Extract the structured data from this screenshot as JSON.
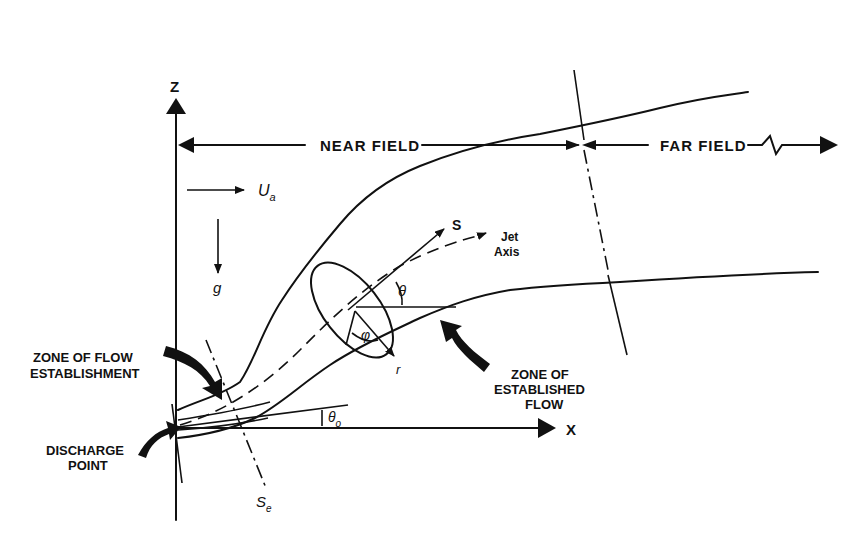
{
  "figure": {
    "type": "schematic",
    "axes": {
      "vertical_label": "Z",
      "horizontal_label": "X"
    },
    "regions": {
      "near_field_label": "NEAR FIELD",
      "far_field_label": "FAR FIELD"
    },
    "symbols": {
      "ambient_velocity": "U",
      "ambient_velocity_subscript": "a",
      "gravity": "g",
      "jet_coordinate": "S",
      "jet_axis_line1": "Jet",
      "jet_axis_line2": "Axis",
      "angle_theta": "θ",
      "angle_phi": "φ",
      "radial": "r",
      "initial_angle": "θ",
      "initial_angle_subscript": "o",
      "establishment_length": "S",
      "establishment_length_subscript": "e"
    },
    "annotations": {
      "zofe_line1": "ZONE OF FLOW",
      "zofe_line2": "ESTABLISHMENT",
      "discharge_line1": "DISCHARGE",
      "discharge_line2": "POINT",
      "zoef_line1": "ZONE OF",
      "zoef_line2": "ESTABLISHED",
      "zoef_line3": "FLOW"
    }
  }
}
